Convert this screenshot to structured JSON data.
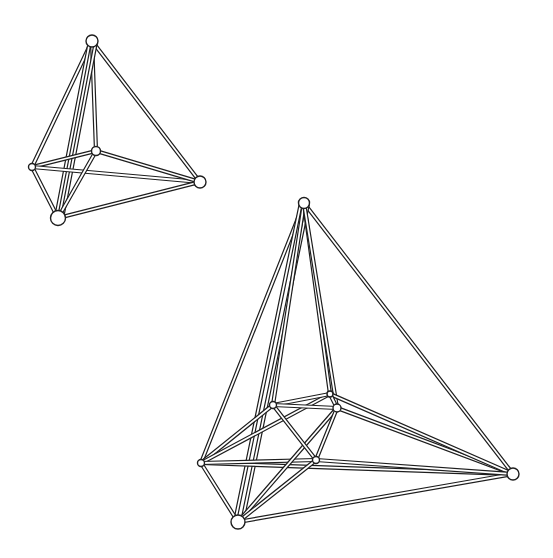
{
  "figures": [
    {
      "name": "small-tetrahedron-frame",
      "rod_width": 4.2,
      "nodes": [
        {
          "id": "top",
          "x": 92,
          "y": 41,
          "r": 6
        },
        {
          "id": "left",
          "x": 32,
          "y": 167,
          "r": 3.5
        },
        {
          "id": "center",
          "x": 96,
          "y": 151,
          "r": 4.5
        },
        {
          "id": "right",
          "x": 200,
          "y": 182,
          "r": 6
        },
        {
          "id": "bottom",
          "x": 58,
          "y": 218,
          "r": 7.5
        }
      ],
      "edges": [
        [
          "top",
          "left"
        ],
        [
          "top",
          "right"
        ],
        [
          "top",
          "center"
        ],
        [
          "top",
          "bottom",
          -4
        ],
        [
          "top",
          "bottom",
          2
        ],
        [
          "left",
          "center"
        ],
        [
          "left",
          "right"
        ],
        [
          "left",
          "bottom"
        ],
        [
          "center",
          "right"
        ],
        [
          "center",
          "bottom"
        ],
        [
          "right",
          "bottom"
        ]
      ]
    },
    {
      "name": "large-tetrahedron-frame",
      "rod_width": 4.2,
      "nodes": [
        {
          "id": "top",
          "x": 304,
          "y": 203,
          "r": 5.5
        },
        {
          "id": "left",
          "x": 201,
          "y": 463,
          "r": 3.5
        },
        {
          "id": "right",
          "x": 513,
          "y": 474,
          "r": 6
        },
        {
          "id": "bottom",
          "x": 238,
          "y": 522,
          "r": 7
        },
        {
          "id": "inA",
          "x": 273,
          "y": 405,
          "r": 3.5
        },
        {
          "id": "inB",
          "x": 330,
          "y": 394,
          "r": 3
        },
        {
          "id": "inC",
          "x": 337,
          "y": 408,
          "r": 4
        },
        {
          "id": "inD",
          "x": 316,
          "y": 460,
          "r": 3.5
        }
      ],
      "edges": [
        [
          "top",
          "left"
        ],
        [
          "top",
          "right"
        ],
        [
          "top",
          "bottom",
          -4
        ],
        [
          "top",
          "bottom",
          3
        ],
        [
          "top",
          "inA"
        ],
        [
          "top",
          "inB"
        ],
        [
          "top",
          "inC"
        ],
        [
          "left",
          "right"
        ],
        [
          "left",
          "bottom"
        ],
        [
          "left",
          "inA"
        ],
        [
          "left",
          "inB"
        ],
        [
          "left",
          "inD"
        ],
        [
          "right",
          "bottom"
        ],
        [
          "right",
          "inC"
        ],
        [
          "right",
          "inB"
        ],
        [
          "right",
          "inD"
        ],
        [
          "bottom",
          "inC"
        ],
        [
          "bottom",
          "inD"
        ],
        [
          "inA",
          "inB"
        ],
        [
          "inA",
          "inC"
        ],
        [
          "inA",
          "inD"
        ],
        [
          "inB",
          "inC"
        ],
        [
          "inC",
          "inD"
        ]
      ]
    }
  ],
  "colors": {
    "ink": "#1e1e1e",
    "paper": "#ffffff"
  }
}
